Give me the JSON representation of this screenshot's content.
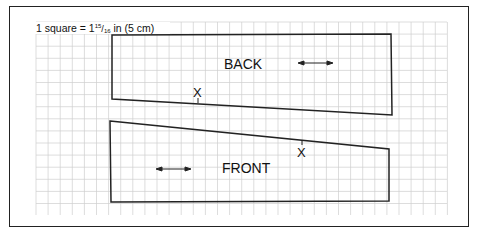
{
  "diagram": {
    "scale_note": "1 square = 1",
    "scale_fraction_num": "15",
    "scale_fraction_den": "16",
    "scale_suffix": " in (5 cm)",
    "pieces": [
      {
        "name": "BACK",
        "grain_marker": "double-arrow",
        "notch": "X"
      },
      {
        "name": "FRONT",
        "grain_marker": "double-arrow",
        "notch": "X"
      }
    ],
    "grid": {
      "x0": 36,
      "y0": 22,
      "x1": 447,
      "y1": 215,
      "step": 12.1
    },
    "colors": {
      "grid": "#c8c8c8",
      "outline": "#222222",
      "text": "#111111"
    }
  }
}
